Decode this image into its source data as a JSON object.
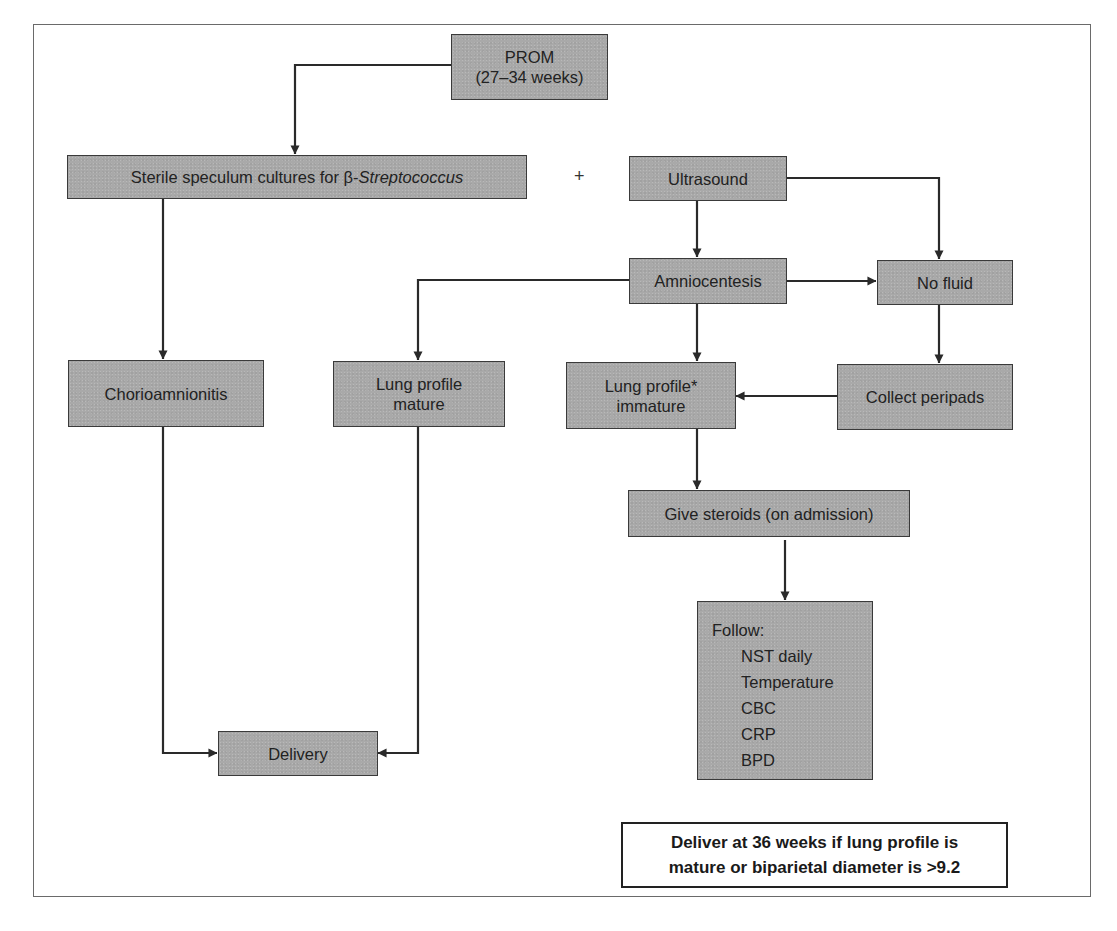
{
  "diagram": {
    "type": "flowchart",
    "nodes": {
      "prom": {
        "line1": "PROM",
        "line2": "(27–34 weeks)"
      },
      "cultures": {
        "text_prefix": "Sterile speculum cultures for β-",
        "text_italic": "Streptococcus"
      },
      "plus_sign": "+",
      "ultrasound": {
        "text": "Ultrasound"
      },
      "amniocentesis": {
        "text": "Amniocentesis"
      },
      "no_fluid": {
        "text": "No fluid"
      },
      "chorioamnionitis": {
        "text": "Chorioamnionitis"
      },
      "lung_mature": {
        "line1": "Lung profile",
        "line2": "mature"
      },
      "lung_immature": {
        "line1": "Lung profile*",
        "line2": "immature"
      },
      "collect_peripads": {
        "text": "Collect peripads"
      },
      "give_steroids": {
        "text": "Give steroids (on admission)"
      },
      "follow": {
        "heading": "Follow:",
        "items": [
          "NST daily",
          "Temperature",
          "CBC",
          "CRP",
          "BPD"
        ]
      },
      "delivery": {
        "text": "Delivery"
      }
    },
    "note": {
      "line1": "Deliver at 36 weeks if lung profile is",
      "line2": "mature or biparietal diameter is >9.2"
    },
    "edges": [
      {
        "from": "PROM",
        "to": "Sterile speculum cultures"
      },
      {
        "from": "Sterile speculum cultures",
        "to": "Chorioamnionitis"
      },
      {
        "from": "Ultrasound",
        "to": "Amniocentesis"
      },
      {
        "from": "Ultrasound",
        "to": "No fluid"
      },
      {
        "from": "Amniocentesis",
        "to": "No fluid"
      },
      {
        "from": "Amniocentesis",
        "to": "Lung profile mature"
      },
      {
        "from": "Amniocentesis",
        "to": "Lung profile immature"
      },
      {
        "from": "No fluid",
        "to": "Collect peripads"
      },
      {
        "from": "Collect peripads",
        "to": "Lung profile immature"
      },
      {
        "from": "Lung profile immature",
        "to": "Give steroids (on admission)"
      },
      {
        "from": "Give steroids (on admission)",
        "to": "Follow"
      },
      {
        "from": "Chorioamnionitis",
        "to": "Delivery"
      },
      {
        "from": "Lung profile mature",
        "to": "Delivery"
      }
    ],
    "colors": {
      "box_fill": "#a9a9a9",
      "box_border": "#3a3a3a",
      "line": "#2a2a2a",
      "frame": "#6a6a6a"
    }
  }
}
